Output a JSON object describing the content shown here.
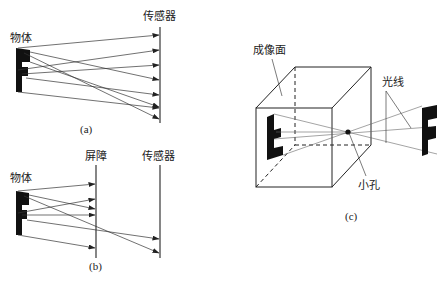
{
  "panel_a": {
    "object_label": "物体",
    "sensor_label": "传感器",
    "caption": "(a)"
  },
  "panel_b": {
    "object_label": "物体",
    "barrier_label": "屏障",
    "sensor_label": "传感器",
    "caption": "(b)"
  },
  "panel_c": {
    "image_plane_label": "成像面",
    "light_rays_label": "光线",
    "pinhole_label": "小孔",
    "caption": "(c)"
  },
  "colors": {
    "ink": "#222222",
    "background": "#ffffff"
  }
}
